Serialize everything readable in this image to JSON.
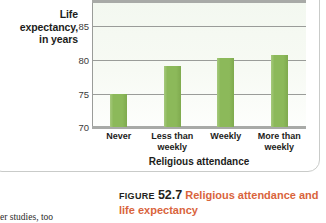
{
  "chart_data": {
    "type": "bar",
    "title": "",
    "categories": [
      "Never",
      "Less than weekly",
      "Weekly",
      "More than weekly"
    ],
    "values": [
      75.2,
      79.7,
      80.9,
      81.5
    ],
    "xlabel": "Religious attendance",
    "ylabel": "Life expectancy, in years",
    "ylim": [
      70,
      90
    ],
    "yticks": [
      85,
      80,
      75,
      70
    ],
    "ytick_labels": [
      "85",
      "80",
      "75",
      "70"
    ],
    "gridlines": [
      90,
      85,
      80,
      75,
      70
    ],
    "grid": true,
    "legend": "none",
    "bar_color": "#8cb95a",
    "plot_background": "#f4f9f1"
  },
  "axes": {
    "y_title_lines": [
      "Life",
      "expectancy,",
      "in years"
    ],
    "y_title": "Life expectancy, in years",
    "x_title": "Religious attendance"
  },
  "categories": [
    {
      "lines": [
        "Never"
      ]
    },
    {
      "lines": [
        "Less than",
        "weekly"
      ]
    },
    {
      "lines": [
        "Weekly"
      ]
    },
    {
      "lines": [
        "More than",
        "weekly"
      ]
    }
  ],
  "caption": {
    "figure_word": "FIGURE",
    "figure_number": "52.7",
    "title": "Religious attendance and life expectancy"
  },
  "body_text": {
    "fragment": "er studies, too"
  },
  "colors": {
    "accent_orange": "#d9643c",
    "bar_green": "#8cb95a",
    "axis_gray": "#9a9c99",
    "panel_border": "#c9cbc9"
  }
}
